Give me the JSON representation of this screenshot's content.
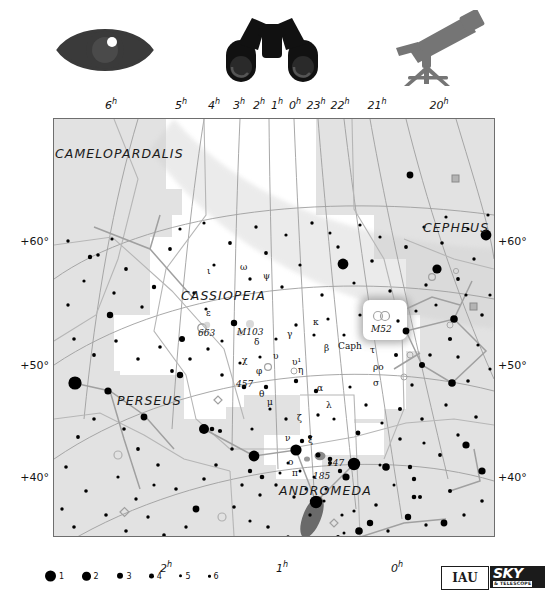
{
  "chart_data": {
    "type": "scatter",
    "title": "Cassiopeia",
    "xlabel": "Right Ascension (hours)",
    "ylabel": "Declination (degrees)",
    "xlim": [
      6.5,
      19.5
    ],
    "ylim": [
      33,
      72
    ],
    "grid": true,
    "legend_position": "bottom-left",
    "ra_ticks_top": [
      "6h",
      "5h",
      "4h",
      "3h",
      "2h",
      "1h",
      "0h",
      "23h",
      "22h",
      "21h",
      "20h"
    ],
    "ra_ticks_bottom": [
      "2h",
      "1h",
      "0h"
    ],
    "dec_ticks_left": [
      "+60°",
      "+50°",
      "+40°"
    ],
    "dec_ticks_right": [
      "+60°",
      "+50°",
      "+40°"
    ],
    "magnitude_legend": [
      1,
      2,
      3,
      4,
      5,
      6
    ],
    "constellations": [
      "CAMELOPARDALIS",
      "CASSIOPEIA",
      "CEPHEUS",
      "PERSEUS",
      "ANDROMEDA"
    ],
    "labeled_stars": [
      {
        "label": "ι",
        "ra": 2.48,
        "dec": 67.4,
        "mag": 4.5
      },
      {
        "label": "ω",
        "ra": 1.96,
        "dec": 68.7,
        "mag": 4.9
      },
      {
        "label": "ψ",
        "ra": 1.43,
        "dec": 68.1,
        "mag": 4.7
      },
      {
        "label": "ε",
        "ra": 1.91,
        "dec": 63.7,
        "mag": 3.4
      },
      {
        "label": "δ",
        "ra": 1.43,
        "dec": 60.2,
        "mag": 2.7
      },
      {
        "label": "γ",
        "ra": 0.95,
        "dec": 60.7,
        "mag": 2.2
      },
      {
        "label": "α",
        "ra": 0.68,
        "dec": 56.5,
        "mag": 2.2
      },
      {
        "label": "β",
        "ra": 0.15,
        "dec": 59.1,
        "mag": 2.3
      },
      {
        "label": "Caph",
        "ra": 0.15,
        "dec": 59.1,
        "mag": 2.3
      },
      {
        "label": "κ",
        "ra": 0.53,
        "dec": 62.9,
        "mag": 4.2
      },
      {
        "label": "χ",
        "ra": 1.56,
        "dec": 59.2,
        "mag": 4.7
      },
      {
        "label": "φ",
        "ra": 1.35,
        "dec": 58.2,
        "mag": 5.0
      },
      {
        "label": "υ",
        "ra": 0.92,
        "dec": 59.0,
        "mag": 4.6
      },
      {
        "label": "υ¹",
        "ra": 0.9,
        "dec": 58.2,
        "mag": 4.8
      },
      {
        "label": "η",
        "ra": 0.82,
        "dec": 57.8,
        "mag": 3.4
      },
      {
        "label": "θ",
        "ra": 1.19,
        "dec": 55.1,
        "mag": 4.3
      },
      {
        "label": "μ",
        "ra": 1.13,
        "dec": 54.9,
        "mag": 5.1
      },
      {
        "label": "ζ",
        "ra": 0.61,
        "dec": 53.9,
        "mag": 3.6
      },
      {
        "label": "λ",
        "ra": 0.52,
        "dec": 54.5,
        "mag": 4.7
      },
      {
        "label": "τ",
        "ra": 23.78,
        "dec": 58.1,
        "mag": 4.8
      },
      {
        "label": "ρο",
        "ra": 23.88,
        "dec": 57.5,
        "mag": 4.5
      },
      {
        "label": "σ",
        "ra": 23.75,
        "dec": 55.8,
        "mag": 4.9
      },
      {
        "label": "ν",
        "ra": 0.82,
        "dec": 50.9,
        "mag": 4.9
      },
      {
        "label": "ξ",
        "ra": 0.7,
        "dec": 50.5,
        "mag": 4.8
      },
      {
        "label": "ο",
        "ra": 0.75,
        "dec": 48.4,
        "mag": 4.5
      },
      {
        "label": "π",
        "ra": 0.78,
        "dec": 47.5,
        "mag": 5.0
      }
    ],
    "deep_sky_objects": [
      {
        "label": "M52",
        "ra": 23.4,
        "dec": 61.6,
        "type": "open cluster",
        "highlighted": true
      },
      {
        "label": "M103",
        "ra": 1.55,
        "dec": 60.7,
        "type": "open cluster"
      },
      {
        "label": "663",
        "ra": 1.77,
        "dec": 61.2,
        "type": "open cluster"
      },
      {
        "label": "457",
        "ra": 1.32,
        "dec": 58.3,
        "type": "open cluster"
      },
      {
        "label": "147",
        "ra": 0.55,
        "dec": 48.5,
        "type": "galaxy"
      },
      {
        "label": "185",
        "ra": 0.65,
        "dec": 48.3,
        "type": "galaxy"
      }
    ]
  },
  "top_icons": [
    {
      "name": "eye-icon",
      "label": "naked eye"
    },
    {
      "name": "binoculars-icon",
      "label": "binoculars"
    },
    {
      "name": "telescope-icon",
      "label": "telescope"
    }
  ],
  "ra_top": [
    {
      "text": "6",
      "sup": "h",
      "x": 111
    },
    {
      "text": "5",
      "sup": "h",
      "x": 181
    },
    {
      "text": "4",
      "sup": "h",
      "x": 214
    },
    {
      "text": "3",
      "sup": "h",
      "x": 239
    },
    {
      "text": "2",
      "sup": "h",
      "x": 259
    },
    {
      "text": "1",
      "sup": "h",
      "x": 277
    },
    {
      "text": "0",
      "sup": "h",
      "x": 295
    },
    {
      "text": "23",
      "sup": "h",
      "x": 316
    },
    {
      "text": "22",
      "sup": "h",
      "x": 340
    },
    {
      "text": "21",
      "sup": "h",
      "x": 377
    },
    {
      "text": "20",
      "sup": "h",
      "x": 439
    }
  ],
  "ra_bottom": [
    {
      "text": "2",
      "sup": "h",
      "x": 166
    },
    {
      "text": "1",
      "sup": "h",
      "x": 282
    },
    {
      "text": "0",
      "sup": "h",
      "x": 397
    }
  ],
  "dec_left": [
    {
      "text": "+60°",
      "y": 241
    },
    {
      "text": "+50°",
      "y": 365
    },
    {
      "text": "+40°",
      "y": 477
    }
  ],
  "dec_right": [
    {
      "text": "+60°",
      "y": 241
    },
    {
      "text": "+50°",
      "y": 365
    },
    {
      "text": "+40°",
      "y": 477
    }
  ],
  "constellation_names": [
    {
      "text": "CAMELOPARDALIS",
      "x": 54,
      "y": 145
    },
    {
      "text": "CASSIOPEIA",
      "x": 180,
      "y": 287
    },
    {
      "text": "CEPHEUS",
      "x": 422,
      "y": 219
    },
    {
      "text": "PERSEUS",
      "x": 116,
      "y": 392
    },
    {
      "text": "ANDROMEDA",
      "x": 278,
      "y": 482
    }
  ],
  "star_labels": [
    {
      "text": "ι",
      "x": 206,
      "y": 265
    },
    {
      "text": "ω",
      "x": 239,
      "y": 261
    },
    {
      "text": "ψ",
      "x": 262,
      "y": 270
    },
    {
      "text": "ε",
      "x": 205,
      "y": 307
    },
    {
      "text": "δ",
      "x": 253,
      "y": 336
    },
    {
      "text": "γ",
      "x": 286,
      "y": 328
    },
    {
      "text": "α",
      "x": 316,
      "y": 382
    },
    {
      "text": "β",
      "x": 323,
      "y": 342
    },
    {
      "text": "Caph",
      "x": 337,
      "y": 340
    },
    {
      "text": "κ",
      "x": 312,
      "y": 316
    },
    {
      "text": "χ",
      "x": 241,
      "y": 354
    },
    {
      "text": "φ",
      "x": 255,
      "y": 365
    },
    {
      "text": "υ",
      "x": 272,
      "y": 350
    },
    {
      "text": "υ¹",
      "x": 291,
      "y": 356
    },
    {
      "text": "η",
      "x": 297,
      "y": 364
    },
    {
      "text": "θ",
      "x": 258,
      "y": 388
    },
    {
      "text": "μ",
      "x": 266,
      "y": 396
    },
    {
      "text": "ζ",
      "x": 296,
      "y": 412
    },
    {
      "text": "λ",
      "x": 325,
      "y": 399
    },
    {
      "text": "τ",
      "x": 369,
      "y": 344
    },
    {
      "text": "ρο",
      "x": 372,
      "y": 361
    },
    {
      "text": "σ",
      "x": 372,
      "y": 377
    },
    {
      "text": "ν",
      "x": 284,
      "y": 432
    },
    {
      "text": "ξ",
      "x": 307,
      "y": 434
    },
    {
      "text": "ο",
      "x": 287,
      "y": 456
    },
    {
      "text": "π",
      "x": 291,
      "y": 467
    }
  ],
  "dso_labels": [
    {
      "text": "M52",
      "x": 370,
      "y": 323
    },
    {
      "text": "M103",
      "x": 236,
      "y": 326
    },
    {
      "text": "663",
      "x": 197,
      "y": 327
    },
    {
      "text": "457",
      "x": 235,
      "y": 378
    },
    {
      "text": "147",
      "x": 326,
      "y": 457
    },
    {
      "text": "185",
      "x": 312,
      "y": 470
    }
  ],
  "magnitude_legend": [
    {
      "num": "1",
      "x": 0,
      "size": 11
    },
    {
      "num": "2",
      "x": 37,
      "size": 8.5
    },
    {
      "num": "3",
      "x": 72,
      "size": 6.4
    },
    {
      "num": "4",
      "x": 104,
      "size": 4.8
    },
    {
      "num": "5",
      "x": 134,
      "size": 3.4
    },
    {
      "num": "6",
      "x": 163,
      "size": 2.6
    }
  ],
  "logos": {
    "iau_text": "IAU",
    "sky_text": "SKY",
    "telescope_text": "& TELESCOPE"
  },
  "colors": {
    "frame": "#6e6e6e",
    "sky_shaded": "#e2e2e2",
    "sky_highlight": "#ffffff",
    "grid_line": "#9a9a9a",
    "boundary_line": "#b4b4b4",
    "star": "#000000",
    "text": "#1a1a1a"
  }
}
